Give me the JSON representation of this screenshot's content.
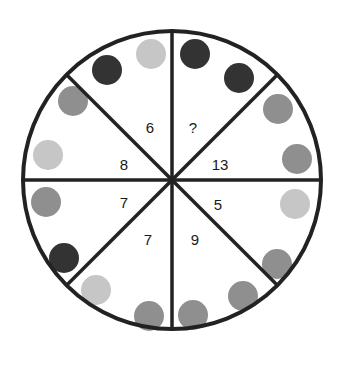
{
  "puzzle": {
    "type": "number-wheel",
    "center": {
      "x": 172,
      "y": 180
    },
    "radius": 149,
    "colors": {
      "outline": "#222222",
      "dark": "#333333",
      "medium": "#8f8f8f",
      "light": "#c6c6c6"
    },
    "segments": [
      {
        "label": "6",
        "label_pos": [
          150,
          133
        ],
        "circles": [
          {
            "shade": "dark",
            "x": 107,
            "y": 70
          },
          {
            "shade": "light",
            "x": 151,
            "y": 54
          }
        ]
      },
      {
        "label": "?",
        "label_pos": [
          193,
          133
        ],
        "circles": [
          {
            "shade": "dark",
            "x": 195,
            "y": 54
          },
          {
            "shade": "dark",
            "x": 239,
            "y": 78
          }
        ]
      },
      {
        "label": "13",
        "label_pos": [
          220,
          170
        ],
        "circles": [
          {
            "shade": "medium",
            "x": 278,
            "y": 109
          },
          {
            "shade": "medium",
            "x": 297,
            "y": 159
          }
        ]
      },
      {
        "label": "5",
        "label_pos": [
          218,
          210
        ],
        "circles": [
          {
            "shade": "light",
            "x": 295,
            "y": 204
          },
          {
            "shade": "medium",
            "x": 277,
            "y": 264
          }
        ]
      },
      {
        "label": "9",
        "label_pos": [
          195,
          245
        ],
        "circles": [
          {
            "shade": "medium",
            "x": 243,
            "y": 296
          },
          {
            "shade": "medium",
            "x": 193,
            "y": 315
          }
        ]
      },
      {
        "label": "7",
        "label_pos": [
          148,
          245
        ],
        "circles": [
          {
            "shade": "light",
            "x": 96,
            "y": 290
          },
          {
            "shade": "medium",
            "x": 149,
            "y": 316
          }
        ]
      },
      {
        "label": "7",
        "label_pos": [
          124,
          208
        ],
        "circles": [
          {
            "shade": "medium",
            "x": 46,
            "y": 202
          },
          {
            "shade": "dark",
            "x": 64,
            "y": 258
          }
        ]
      },
      {
        "label": "8",
        "label_pos": [
          124,
          170
        ],
        "circles": [
          {
            "shade": "medium",
            "x": 73,
            "y": 101
          },
          {
            "shade": "light",
            "x": 48,
            "y": 155
          }
        ]
      }
    ]
  }
}
